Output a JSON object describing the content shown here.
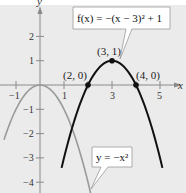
{
  "chart_data": {
    "type": "line",
    "title": "",
    "xlabel": "x",
    "ylabel": "y",
    "xlim": [
      -1.6,
      5.9
    ],
    "ylim": [
      -4.4,
      3.2
    ],
    "grid": false,
    "x_ticks": [
      -1,
      1,
      3,
      5
    ],
    "y_ticks": [
      2,
      1,
      -1,
      -2,
      -3,
      -4
    ],
    "x_tick_labels": [
      "-1",
      "1",
      "3",
      "5"
    ],
    "y_tick_labels": [
      "2",
      "1",
      "-1",
      "-2",
      "-3",
      "-4"
    ],
    "series": [
      {
        "name": "f(x) = -(x - 3)^2 + 1",
        "label": "f(x) = −(x − 3)² + 1",
        "color": "#111111",
        "formula": {
          "a": -1,
          "h": 3,
          "k": 1
        },
        "x_range": [
          0.9,
          5.1
        ]
      },
      {
        "name": "y = -x^2",
        "label": "y = −x²",
        "color": "#999999",
        "formula": {
          "a": -1,
          "h": 0,
          "k": 0
        },
        "x_range": [
          -1.5,
          2.15
        ]
      }
    ],
    "points": [
      {
        "x": 2,
        "y": 0,
        "label": "(2, 0)"
      },
      {
        "x": 3,
        "y": 1,
        "label": "(3, 1)"
      },
      {
        "x": 4,
        "y": 0,
        "label": "(4, 0)"
      }
    ]
  },
  "labels": {
    "x_axis": "x",
    "y_axis": "y",
    "f_callout": "f(x) = −(x − 3)² + 1",
    "g_callout": "y = −x²",
    "pt_2_0": "(2, 0)",
    "pt_3_1": "(3, 1)",
    "pt_4_0": "(4, 0)",
    "tick_x_m1": "−1",
    "tick_x_1": "1",
    "tick_x_3": "3",
    "tick_x_5": "5",
    "tick_y_2": "2",
    "tick_y_1": "1",
    "tick_y_m1": "−1",
    "tick_y_m2": "−2",
    "tick_y_m3": "−3",
    "tick_y_m4": "−4"
  },
  "colors": {
    "background": "#ebebeb",
    "axis": "#888888",
    "f_curve": "#111111",
    "g_curve": "#9a9a9a"
  }
}
